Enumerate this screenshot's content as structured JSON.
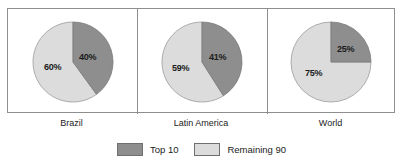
{
  "chart_data": {
    "type": "pie",
    "title": "",
    "legend_position": "bottom",
    "series_names": [
      "Top 10",
      "Remaining 90"
    ],
    "colors": {
      "top10": "#8e8e8e",
      "remaining90": "#dcdcdc",
      "outline": "#6f6f6f",
      "frame": "#8e8e8e",
      "text": "#1b1b1b"
    },
    "panels": [
      {
        "label": "Brazil",
        "slices": [
          {
            "name": "Top 10",
            "value": 40,
            "label": "40%"
          },
          {
            "name": "Remaining 90",
            "value": 60,
            "label": "60%"
          }
        ]
      },
      {
        "label": "Latin America",
        "slices": [
          {
            "name": "Top 10",
            "value": 41,
            "label": "41%"
          },
          {
            "name": "Remaining 90",
            "value": 59,
            "label": "59%"
          }
        ]
      },
      {
        "label": "World",
        "slices": [
          {
            "name": "Top 10",
            "value": 25,
            "label": "25%"
          },
          {
            "name": "Remaining 90",
            "value": 75,
            "label": "75%"
          }
        ]
      }
    ]
  },
  "legend": {
    "items": [
      {
        "label": "Top 10",
        "swatch": "#8e8e8e"
      },
      {
        "label": "Remaining 90",
        "swatch": "#dcdcdc"
      }
    ]
  }
}
